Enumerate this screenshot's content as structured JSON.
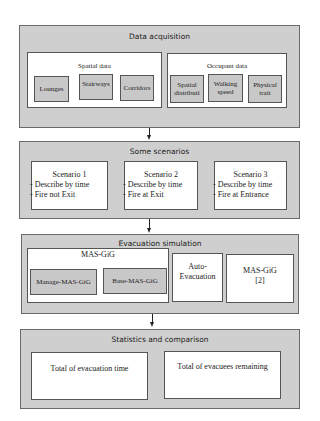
{
  "stages": {
    "data_acquisition": {
      "title": "Data acquisition",
      "spatial": {
        "title": "Spatial data",
        "items": [
          "Lounges",
          "Stairways",
          "Corridors"
        ]
      },
      "occupant": {
        "title": "Occupant data",
        "items": [
          "Spatial\ndistributi",
          "Walking\nspeed",
          "Physical\ntrait"
        ]
      }
    },
    "scenarios": {
      "title": "Some scenarios",
      "items": [
        {
          "title": "Scenario 1",
          "lines": [
            "Describe by time",
            "Fire not Exit"
          ]
        },
        {
          "title": "Scenario 2",
          "lines": [
            "Describe by time",
            "Fire at Exit"
          ]
        },
        {
          "title": "Scenario 3",
          "lines": [
            "Describe by time",
            "Fire at Entrance"
          ]
        }
      ]
    },
    "evacuation_simulation": {
      "title": "Evacuation simulation",
      "mas_gig": {
        "title": "MAS-GiG",
        "items": [
          "Manage-MAS-GiG",
          "Base-MAS-GiG"
        ]
      },
      "auto_evacuation": "Auto-\nEvacuation",
      "mas_gig_ref": "MAS-GiG\n[2]"
    },
    "statistics": {
      "title": "Statistics and comparison",
      "items": [
        "Total of evacuation time",
        "Total of evacuees remaining"
      ]
    }
  },
  "colors": {
    "stage_fill": "#cfcfcf",
    "chip_fill": "#c8c8c8",
    "border": "#555555",
    "arrow": "#222222"
  }
}
